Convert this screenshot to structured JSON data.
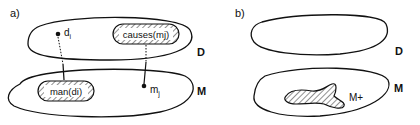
{
  "panels": [
    {
      "id": "a",
      "label": "a)",
      "sets": {
        "top": "D",
        "bottom": "M"
      },
      "regions": [
        {
          "label": "causes(mj)",
          "set": "D",
          "hatched": true
        },
        {
          "label": "man(di)",
          "set": "M",
          "hatched": true
        }
      ],
      "points": [
        {
          "label": "d",
          "sub": "i",
          "set": "D"
        },
        {
          "label": "m",
          "sub": "j",
          "set": "M"
        }
      ],
      "links": [
        {
          "from": "d_i",
          "to": "man(d_i)",
          "style": "dotted-then-solid"
        },
        {
          "from": "causes(m_j)",
          "to": "m_j",
          "style": "dotted-then-solid"
        }
      ]
    },
    {
      "id": "b",
      "label": "b)",
      "sets": {
        "top": "D",
        "bottom": "M"
      },
      "regions": [
        {
          "label": "M+",
          "set": "M",
          "hatched": true
        }
      ]
    }
  ],
  "text": {
    "a_label": "a)",
    "b_label": "b)",
    "a_D": "D",
    "a_M": "M",
    "b_D": "D",
    "b_M": "M",
    "causes": "causes(mj)",
    "man": "man(di)",
    "di_main": "d",
    "di_sub": "i",
    "mj_main": "m",
    "mj_sub": "j",
    "mplus": "M+"
  }
}
